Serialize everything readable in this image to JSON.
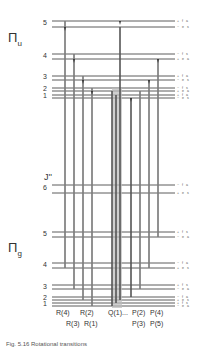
{
  "diagram": {
    "upper_state": {
      "label": "Π",
      "subscript": "u"
    },
    "lower_state": {
      "label": "Π",
      "subscript": "g"
    },
    "j_axis_label": "J''",
    "upper_levels": [
      {
        "j": "5",
        "y": 23,
        "parity": [
          "+ f a",
          "− e s"
        ]
      },
      {
        "j": "4",
        "y": 55,
        "parity": [
          "− f s",
          "+ e a"
        ]
      },
      {
        "j": "3",
        "y": 78,
        "parity": [
          "+ f a",
          "− e s"
        ]
      },
      {
        "j": "2",
        "y": 90,
        "parity": [
          "− f s",
          "+ e a"
        ]
      },
      {
        "j": "1",
        "y": 97,
        "parity": [
          "+ f a",
          "− e s"
        ]
      }
    ],
    "lower_levels": [
      {
        "j": "6",
        "y": 75,
        "parity": [
          "− f a",
          "+ e s"
        ]
      },
      {
        "j": "5",
        "y": 233,
        "parity": [
          "+ f s",
          "− e a"
        ]
      },
      {
        "j": "4",
        "y": 264,
        "parity": [
          "− f a",
          "+ e s"
        ]
      },
      {
        "j": "3",
        "y": 287,
        "parity": [
          "+ f s",
          "− e a"
        ]
      },
      {
        "j": "2",
        "y": 298,
        "parity": [
          "− f a",
          "+ e s"
        ]
      },
      {
        "j": "1",
        "y": 304,
        "parity": [
          "+ f s",
          "− e a"
        ]
      }
    ],
    "branch_labels_row1": [
      "R(4)",
      "R(2)",
      "Q(1)...",
      "P(2)",
      "P(4)"
    ],
    "branch_labels_row2": [
      "R(3)",
      "R(1)",
      "P(3)",
      "P(5)"
    ],
    "caption": "Fig. 5.16 Rotational transitions"
  },
  "colors": {
    "line": "#333333",
    "band": "#aaaaaa",
    "background": "#ffffff"
  }
}
